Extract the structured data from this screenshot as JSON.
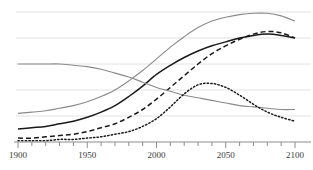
{
  "chart_data": {
    "type": "line",
    "title": "",
    "subtitle": "",
    "xlabel": "",
    "ylabel": "",
    "xlim": [
      1900,
      2100
    ],
    "ylim": [
      0,
      100
    ],
    "grid": true,
    "grid_orientation": "horizontal",
    "gridline_values": [
      20,
      40,
      60,
      80,
      100
    ],
    "legend": "none",
    "axis": {
      "x_tick_labels": [
        "1900",
        "1950",
        "2000",
        "2050",
        "2100"
      ],
      "x_major_ticks": [
        1900,
        1950,
        2000,
        2050,
        2100
      ],
      "x_minor_tick_step": 10,
      "y_axis_visible": false,
      "x_axis_line_color": "#8c8c8c"
    },
    "colors": {
      "series_gray_upper": "#8a8a8a",
      "series_black_solid": "#1a1a1a",
      "series_black_dashed": "#1a1a1a",
      "series_gray_declining": "#8a8a8a",
      "series_black_dotted": "#1a1a1a",
      "gridline": "#e2e2e2",
      "background": "#ffffff",
      "tick_label": "#3a3a3a"
    },
    "x": [
      1900,
      1910,
      1920,
      1930,
      1940,
      1950,
      1960,
      1970,
      1980,
      1990,
      2000,
      2010,
      2020,
      2030,
      2040,
      2050,
      2060,
      2070,
      2080,
      2090,
      2100
    ],
    "series": [
      {
        "name": "Upper gray sigmoid",
        "style": "solid",
        "color": "#8a8a8a",
        "width": 1.1,
        "values": [
          22,
          23,
          24,
          26,
          28,
          31,
          35,
          40,
          47,
          55,
          64,
          73,
          81,
          88,
          93,
          96,
          98,
          99,
          99,
          97,
          93
        ]
      },
      {
        "name": "Black solid sigmoid",
        "style": "solid",
        "color": "#1a1a1a",
        "width": 1.5,
        "values": [
          10,
          11,
          12,
          14,
          16,
          19,
          23,
          28,
          35,
          43,
          52,
          59,
          65,
          70,
          74,
          77,
          80,
          82,
          83,
          82,
          80
        ]
      },
      {
        "name": "Black dashed sigmoid",
        "style": "dashed",
        "color": "#1a1a1a",
        "width": 1.5,
        "values": [
          3,
          3,
          4,
          5,
          6,
          8,
          11,
          14,
          19,
          25,
          33,
          42,
          51,
          60,
          68,
          74,
          79,
          83,
          85,
          84,
          80
        ]
      },
      {
        "name": "Gray declining curve",
        "style": "solid",
        "color": "#8a8a8a",
        "width": 1.1,
        "values": [
          60,
          60,
          60,
          60,
          59,
          58,
          56,
          53,
          50,
          46,
          42,
          39,
          36,
          34,
          32,
          30,
          28,
          27,
          26,
          25,
          25
        ]
      },
      {
        "name": "Black dotted hump",
        "style": "dotted",
        "color": "#1a1a1a",
        "width": 1.5,
        "values": [
          1,
          1,
          1,
          2,
          2,
          3,
          4,
          6,
          8,
          12,
          18,
          27,
          37,
          44,
          45,
          42,
          36,
          29,
          23,
          19,
          16
        ]
      }
    ]
  }
}
